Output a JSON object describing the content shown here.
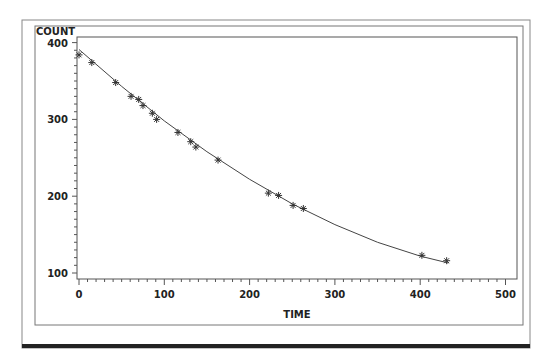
{
  "chart_data": {
    "type": "scatter",
    "title": "",
    "xlabel": "TIME",
    "ylabel": "COUNT",
    "xlim": [
      0,
      500
    ],
    "ylim": [
      100,
      400
    ],
    "x_ticks": [
      0,
      100,
      200,
      300,
      400,
      500
    ],
    "y_ticks": [
      100,
      200,
      300,
      400
    ],
    "x_tick_labels": [
      "0",
      "100",
      "200",
      "300",
      "400",
      "500"
    ],
    "y_tick_labels": [
      "100",
      "200",
      "300",
      "400"
    ],
    "grid": false,
    "legend": null,
    "series": [
      {
        "name": "observed",
        "marker": "asterisk",
        "x": [
          0,
          15,
          43,
          61,
          70,
          75,
          86,
          91,
          116,
          131,
          137,
          163,
          222,
          234,
          251,
          263,
          402,
          431
        ],
        "y": [
          384,
          374,
          348,
          330,
          326,
          318,
          308,
          300,
          283,
          271,
          264,
          247,
          204,
          201,
          188,
          184,
          123,
          116
        ]
      },
      {
        "name": "fitted curve",
        "type": "line",
        "x": [
          0,
          50,
          100,
          150,
          200,
          250,
          300,
          350,
          400,
          433
        ],
        "y": [
          391,
          343,
          298,
          258,
          222,
          190,
          163,
          140,
          122,
          113
        ]
      }
    ]
  }
}
